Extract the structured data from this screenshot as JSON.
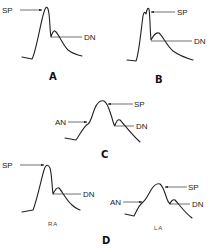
{
  "figure": {
    "colors": {
      "stroke": "#222222",
      "background": "#ffffff"
    }
  },
  "panels": {
    "A": {
      "label": "A",
      "annotations": {
        "sp": "SP",
        "dn": "DN"
      }
    },
    "B": {
      "label": "B",
      "annotations": {
        "sp": "SP",
        "dn": "DN"
      }
    },
    "C": {
      "label": "C",
      "annotations": {
        "sp": "SP",
        "an": "AN",
        "dn": "DN"
      }
    },
    "D": {
      "label": "D",
      "left": {
        "sublabel": "RA",
        "annotations": {
          "sp": "SP",
          "dn": "DN"
        }
      },
      "right": {
        "sublabel": "LA",
        "annotations": {
          "sp": "SP",
          "an": "AN",
          "dn": "DN"
        }
      }
    }
  }
}
